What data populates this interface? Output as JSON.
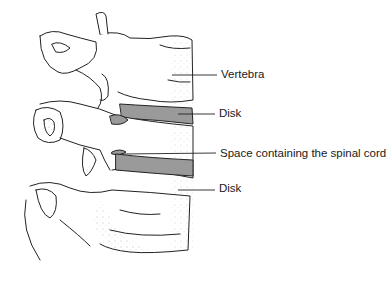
{
  "diagram": {
    "labels": [
      {
        "id": "vertebra",
        "text": "Vertebra",
        "x": 221,
        "y": 69
      },
      {
        "id": "disk-upper",
        "text": "Disk",
        "x": 219,
        "y": 108
      },
      {
        "id": "spinal-space",
        "text": "Space containing the spinal cord",
        "x": 220,
        "y": 148
      },
      {
        "id": "disk-lower",
        "text": "Disk",
        "x": 219,
        "y": 183
      }
    ],
    "colors": {
      "line": "#222222",
      "disk_fill": "#9a9a9a",
      "stipple": "#777777",
      "background": "#ffffff"
    }
  }
}
